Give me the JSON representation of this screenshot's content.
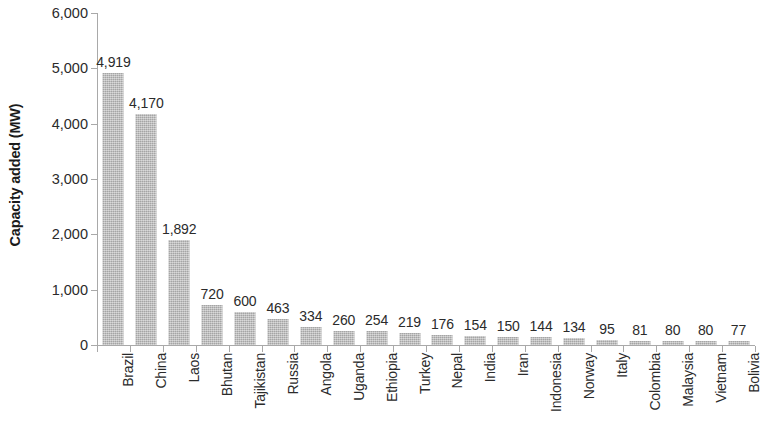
{
  "chart_data": {
    "type": "bar",
    "title": "",
    "subtitle": "",
    "xlabel": "",
    "ylabel": "Capacity added (MW)",
    "ylim": [
      0,
      6000
    ],
    "ytick_step": 1000,
    "ytick_labels": [
      "6,000",
      "5,000",
      "4,000",
      "3,000",
      "2,000",
      "1,000",
      "0"
    ],
    "ytick_values": [
      6000,
      5000,
      4000,
      3000,
      2000,
      1000,
      0
    ],
    "grid": false,
    "legend": null,
    "legend_position": "none",
    "bar_color": "#b9b9b9",
    "axis_color": "#a9a9a9",
    "text_color": "#2b2b2b",
    "background": "#ffffff",
    "categories": [
      "Brazil",
      "China",
      "Laos",
      "Bhutan",
      "Tajikistan",
      "Russia",
      "Angola",
      "Uganda",
      "Ethiopia",
      "Turkey",
      "Nepal",
      "India",
      "Iran",
      "Indonesia",
      "Norway",
      "Italy",
      "Colombia",
      "Malaysia",
      "Vietnam",
      "Bolivia"
    ],
    "values": [
      4919,
      4170,
      1892,
      720,
      600,
      463,
      334,
      260,
      254,
      219,
      176,
      154,
      150,
      144,
      134,
      95,
      81,
      80,
      80,
      77
    ],
    "value_labels": [
      "4,919",
      "4,170",
      "1,892",
      "720",
      "600",
      "463",
      "334",
      "260",
      "254",
      "219",
      "176",
      "154",
      "150",
      "144",
      "134",
      "95",
      "81",
      "80",
      "80",
      "77"
    ]
  }
}
